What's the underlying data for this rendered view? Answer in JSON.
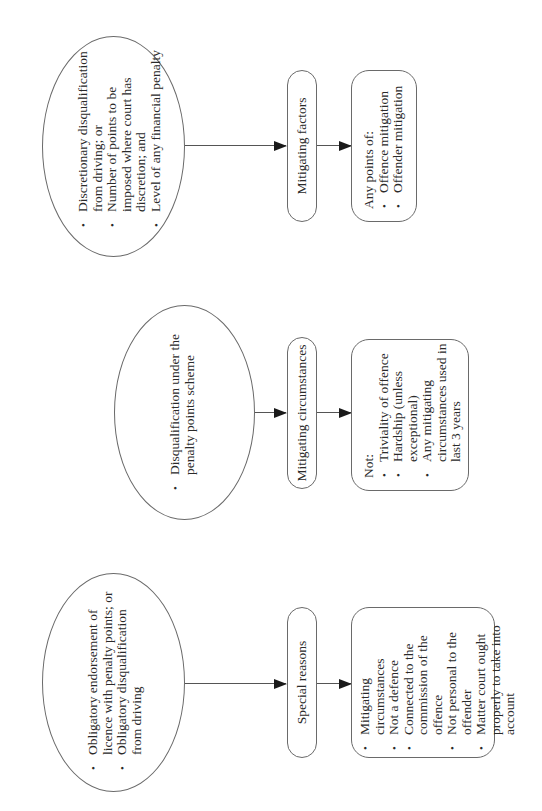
{
  "columns": [
    {
      "source": {
        "items": [
          "Discretionary disqualification from driving; or",
          "Number of points to be imposed where court has discretion; and",
          "Level of any financial penalty"
        ]
      },
      "label": "Mitigating factors",
      "result": {
        "intro": "Any points of:",
        "items": [
          "Offence mitigation",
          "Offender mitigation"
        ]
      }
    },
    {
      "source": {
        "items": [
          "Disqualification under the penalty points scheme"
        ]
      },
      "label": "Mitigating circumstances",
      "result": {
        "intro": "Not:",
        "items": [
          "Triviality of offence",
          "Hardship (unless exceptional)",
          "Any mitigating circumstances used in last 3 years"
        ]
      }
    },
    {
      "source": {
        "items": [
          "Obligatory endorsement of licence with penalty points; or",
          "Obligatory disqualification from driving"
        ]
      },
      "label": "Special reasons",
      "result": {
        "intro": "",
        "items": [
          "Mitigating circumstances",
          "Not a defence",
          "Connected to the commission of the offence",
          "Not personal to the offender",
          "Matter court ought properly to take into account"
        ]
      }
    }
  ],
  "colors": {
    "stroke": "#6a6a6a",
    "arrow": "#1a1a1a",
    "text": "#2a2a2a"
  }
}
